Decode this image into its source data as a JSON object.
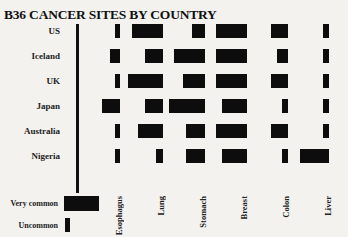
{
  "chart_data": {
    "type": "table",
    "title": "B36 CANCER SITES BY COUNTRY",
    "categories": [
      "US",
      "Iceland",
      "UK",
      "Japan",
      "Australia",
      "Nigeria"
    ],
    "columns": [
      "Esophagus",
      "Lung",
      "Stomach",
      "Breast",
      "Colon",
      "Liver"
    ],
    "value_scale": "bar width in px (wider = more common)",
    "series": [
      {
        "name": "Esophagus",
        "values": [
          5,
          10,
          5,
          18,
          5,
          5
        ]
      },
      {
        "name": "Lung",
        "values": [
          31,
          18,
          35,
          18,
          25,
          7
        ]
      },
      {
        "name": "Stomach",
        "values": [
          13,
          31,
          22,
          36,
          19,
          19
        ]
      },
      {
        "name": "Breast",
        "values": [
          31,
          31,
          31,
          25,
          31,
          25
        ]
      },
      {
        "name": "Colon",
        "values": [
          17,
          11,
          17,
          6,
          17,
          6
        ]
      },
      {
        "name": "Liver",
        "values": [
          6,
          6,
          6,
          6,
          6,
          29
        ]
      }
    ],
    "legend": [
      {
        "label": "Very common",
        "width": 35
      },
      {
        "label": "Uncommon",
        "width": 5
      }
    ],
    "xlabel": "",
    "ylabel": "",
    "grid": false
  },
  "layout": {
    "row_tops": [
      24,
      49,
      74,
      99,
      124,
      149
    ],
    "column_right_edges": [
      120,
      163,
      205,
      247,
      288,
      329
    ],
    "column_label_x": [
      114,
      156,
      198,
      239,
      281,
      323
    ]
  }
}
